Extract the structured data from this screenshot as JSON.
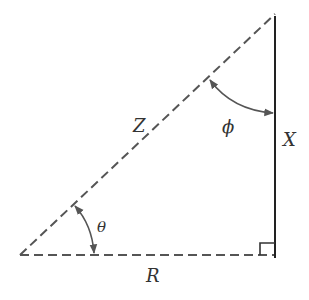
{
  "diagram": {
    "labels": {
      "hypotenuse": "Z",
      "vertical_side": "X",
      "horizontal_side": "R",
      "angle_at_base": "θ",
      "angle_at_top": "ϕ"
    },
    "colors": {
      "stroke": "#555555",
      "solid_line": "#222222",
      "text": "#333333"
    },
    "right_angle_marker": true
  }
}
